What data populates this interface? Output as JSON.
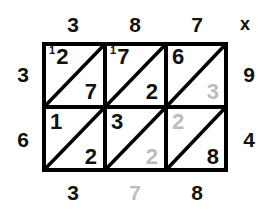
{
  "diagram": {
    "operator_symbol": "x",
    "colors": {
      "ink": "#111111",
      "faded_ink": "#bcbcbc",
      "grid_line": "#000000",
      "background": "#ffffff"
    },
    "grid": {
      "columns": 3,
      "rows": 2
    }
  },
  "labels": {
    "top": [
      {
        "text": "3",
        "faded": false
      },
      {
        "text": "8",
        "faded": false
      },
      {
        "text": "7",
        "faded": false
      }
    ],
    "left": [
      {
        "text": "3",
        "faded": false
      },
      {
        "text": "6",
        "faded": false
      }
    ],
    "right": [
      {
        "text": "9",
        "faded": false
      },
      {
        "text": "4",
        "faded": false
      }
    ],
    "bottom": [
      {
        "text": "3",
        "faded": false
      },
      {
        "text": "7",
        "faded": true
      },
      {
        "text": "8",
        "faded": false
      }
    ]
  },
  "cells": [
    {
      "row": 0,
      "col": 0,
      "carry": "1",
      "upper": "2",
      "upper_faded": false,
      "lower": "7",
      "lower_faded": false
    },
    {
      "row": 0,
      "col": 1,
      "carry": "1",
      "upper": "7",
      "upper_faded": false,
      "lower": "2",
      "lower_faded": false
    },
    {
      "row": 0,
      "col": 2,
      "carry": "",
      "upper": "6",
      "upper_faded": false,
      "lower": "3",
      "lower_faded": true
    },
    {
      "row": 1,
      "col": 0,
      "carry": "",
      "upper": "1",
      "upper_faded": false,
      "lower": "2",
      "lower_faded": false
    },
    {
      "row": 1,
      "col": 1,
      "carry": "",
      "upper": "3",
      "upper_faded": false,
      "lower": "2",
      "lower_faded": true
    },
    {
      "row": 1,
      "col": 2,
      "carry": "",
      "upper": "2",
      "upper_faded": true,
      "lower": "8",
      "lower_faded": false
    }
  ]
}
